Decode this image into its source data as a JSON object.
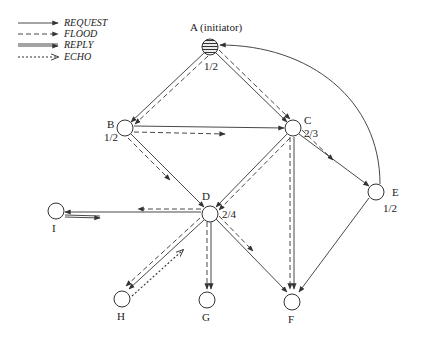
{
  "legend": {
    "items": [
      {
        "key": "request",
        "label": "REQUEST",
        "style": "solid-arrow"
      },
      {
        "key": "flood",
        "label": "FLOOD",
        "style": "dashed-arrow"
      },
      {
        "key": "reply",
        "label": "REPLY",
        "style": "double-solid-arrow"
      },
      {
        "key": "echo",
        "label": "ECHO",
        "style": "dotted-open-arrow"
      }
    ]
  },
  "nodes": {
    "A": {
      "name": "A (initiator)",
      "value": "1/2",
      "filled": true
    },
    "B": {
      "name": "B",
      "value": "1/2"
    },
    "C": {
      "name": "C",
      "value": "2/3"
    },
    "D": {
      "name": "D",
      "value": "2/4"
    },
    "E": {
      "name": "E",
      "value": "1/2"
    },
    "F": {
      "name": "F"
    },
    "G": {
      "name": "G"
    },
    "H": {
      "name": "H"
    },
    "I": {
      "name": "I"
    }
  },
  "edges": [
    {
      "from": "A",
      "to": "B",
      "types": [
        "request",
        "flood"
      ]
    },
    {
      "from": "A",
      "to": "C",
      "types": [
        "request",
        "flood"
      ]
    },
    {
      "from": "B",
      "to": "C",
      "types": [
        "request",
        "flood"
      ]
    },
    {
      "from": "B",
      "to": "D",
      "types": [
        "request",
        "flood"
      ]
    },
    {
      "from": "C",
      "to": "D",
      "types": [
        "request",
        "flood"
      ]
    },
    {
      "from": "C",
      "to": "E",
      "types": [
        "request",
        "flood"
      ]
    },
    {
      "from": "C",
      "to": "F",
      "types": [
        "request",
        "flood"
      ]
    },
    {
      "from": "E",
      "to": "A",
      "types": [
        "request"
      ]
    },
    {
      "from": "E",
      "to": "F",
      "types": [
        "request"
      ]
    },
    {
      "from": "D",
      "to": "I",
      "types": [
        "request",
        "flood"
      ]
    },
    {
      "from": "I",
      "to": "D",
      "types": [
        "reply"
      ]
    },
    {
      "from": "D",
      "to": "H",
      "types": [
        "request",
        "flood"
      ]
    },
    {
      "from": "H",
      "to": "D",
      "types": [
        "echo"
      ]
    },
    {
      "from": "D",
      "to": "G",
      "types": [
        "request",
        "flood"
      ]
    },
    {
      "from": "D",
      "to": "F",
      "types": [
        "request",
        "flood"
      ]
    }
  ]
}
